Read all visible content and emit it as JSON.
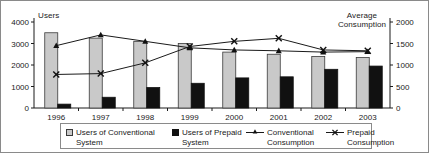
{
  "chart_data": {
    "type": "bar",
    "title": "",
    "categories": [
      "1996",
      "1997",
      "1998",
      "1999",
      "2000",
      "2001",
      "2002",
      "2003"
    ],
    "xlabel": "",
    "ylabel": "Users",
    "y2label": "Average Consumption",
    "ylim": [
      0,
      4000
    ],
    "y2lim": [
      0,
      2000
    ],
    "yticks": [
      "0",
      "1000",
      "2000",
      "3000",
      "4000"
    ],
    "y2ticks": [
      "0",
      "500",
      "1000",
      "1500",
      "2000"
    ],
    "grid": false,
    "legend_position": "bottom",
    "series": [
      {
        "name": "Users of Conventional System",
        "type": "bar",
        "axis": "left",
        "color": "#c9c9c9",
        "values": [
          3500,
          3250,
          3100,
          3000,
          2600,
          2500,
          2400,
          2350
        ]
      },
      {
        "name": "Users of Prepaid System",
        "type": "bar",
        "axis": "left",
        "color": "#111111",
        "values": [
          180,
          500,
          950,
          1150,
          1400,
          1450,
          1800,
          1950
        ]
      },
      {
        "name": "Conventional Consumption",
        "type": "line",
        "axis": "right",
        "color": "#1a1a1a",
        "marker": "triangle",
        "values": [
          1450,
          1700,
          1550,
          1400,
          1350,
          1330,
          1300,
          1310
        ]
      },
      {
        "name": "Prepaid Consumption",
        "type": "line",
        "axis": "right",
        "color": "#1a1a1a",
        "marker": "x",
        "values": [
          780,
          800,
          1050,
          1430,
          1550,
          1620,
          1350,
          1330
        ]
      }
    ]
  },
  "axes": {
    "left_title": "Users",
    "right_title_line1": "Average",
    "right_title_line2": "Consumption"
  },
  "legend": {
    "items": [
      {
        "key": "conventional-users",
        "label": "Users of Conventional\nSystem",
        "marker": "grey-square"
      },
      {
        "key": "prepaid-users",
        "label": "Users of Prepaid\nSystem",
        "marker": "black-square"
      },
      {
        "key": "conventional-consumption",
        "label": "Conventional\nConsumption",
        "marker": "line-triangle"
      },
      {
        "key": "prepaid-consumption",
        "label": "Prepaid\nConsumption",
        "marker": "line-x"
      }
    ]
  }
}
